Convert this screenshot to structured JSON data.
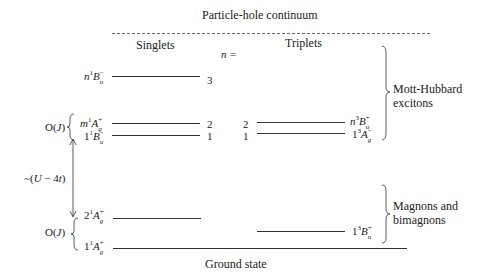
{
  "title": "Particle-hole continuum",
  "columns": {
    "singlets": "Singlets",
    "n_label": "n =",
    "triplets": "Triplets"
  },
  "footer": "Ground state",
  "singlet_levels": [
    {
      "prefix": "n",
      "mult": "1",
      "sym": "B",
      "sup": "−",
      "sub": "u",
      "n": "3"
    },
    {
      "prefix": "m",
      "mult": "1",
      "sym": "A",
      "sup": "+",
      "sub": "g",
      "n": "2"
    },
    {
      "prefix": "1",
      "mult": "1",
      "sym": "B",
      "sup": "−",
      "sub": "u",
      "n": "1"
    },
    {
      "prefix": "2",
      "mult": "1",
      "sym": "A",
      "sup": "+",
      "sub": "g"
    },
    {
      "prefix": "1",
      "mult": "1",
      "sym": "A",
      "sup": "+",
      "sub": "g"
    }
  ],
  "triplet_levels": [
    {
      "n": "2",
      "prefix": "n",
      "mult": "3",
      "sym": "B",
      "sup": "+",
      "sub": "u"
    },
    {
      "n": "1",
      "prefix": "1",
      "mult": "3",
      "sym": "A",
      "sup": "−",
      "sub": "g"
    },
    {
      "prefix": "1",
      "mult": "3",
      "sym": "B",
      "sup": "+",
      "sub": "u"
    }
  ],
  "annotations": {
    "oj_upper": "O(J)",
    "oj_lower": "O(J)",
    "gap": "~(U − 4t)",
    "mott_hubbard": [
      "Mott-Hubbard",
      "excitons"
    ],
    "magnons": [
      "Magnons and",
      "bimagnons"
    ]
  }
}
